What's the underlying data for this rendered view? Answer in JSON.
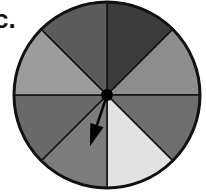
{
  "label": "c.",
  "spinner": {
    "center": [
      107,
      95
    ],
    "radius": 93,
    "sector_count": 8,
    "outline_color": "#111111",
    "sectors": [
      {
        "position": "top-right",
        "start_deg": -90,
        "end_deg": -45,
        "fill": "#3c3c3c"
      },
      {
        "position": "right-upper",
        "start_deg": -45,
        "end_deg": 0,
        "fill": "#8e8e8e"
      },
      {
        "position": "right-lower",
        "start_deg": 0,
        "end_deg": 45,
        "fill": "#6e6e6e"
      },
      {
        "position": "bottom-right",
        "start_deg": 45,
        "end_deg": 90,
        "fill": "#e2e2e2"
      },
      {
        "position": "bottom-left",
        "start_deg": 90,
        "end_deg": 135,
        "fill": "#7c7c7c"
      },
      {
        "position": "left-lower",
        "start_deg": 135,
        "end_deg": 180,
        "fill": "#6a6a6a"
      },
      {
        "position": "left-upper",
        "start_deg": 180,
        "end_deg": 225,
        "fill": "#9c9c9c"
      },
      {
        "position": "top-left",
        "start_deg": 225,
        "end_deg": 270,
        "fill": "#5c5c5c"
      }
    ],
    "pivot": {
      "radius": 6,
      "fill": "#000000"
    },
    "arrow": {
      "pointing_to": "bottom-left",
      "tip": [
        90,
        146
      ],
      "color": "#000000"
    }
  }
}
